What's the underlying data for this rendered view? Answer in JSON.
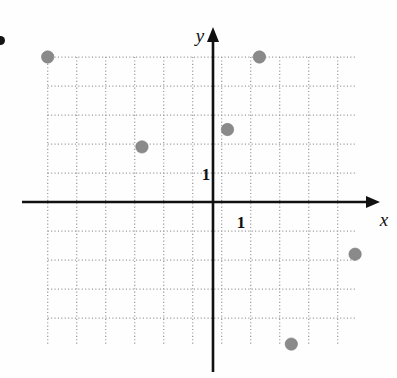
{
  "figure": {
    "problem_bullet": "•",
    "background_color": "#fefefe",
    "point_color": "#8a8a8a",
    "axis_color": "#111111",
    "grid_color": "#9a9a9a"
  },
  "chart_data": {
    "type": "scatter",
    "title": "",
    "subtitle": "",
    "xlabel": "x",
    "ylabel": "y",
    "annotations": [],
    "legend": [],
    "legend_position": "none",
    "grid": true,
    "grid_style": "dotted",
    "grid_step": 1,
    "xlim": [
      -5.7,
      4.9
    ],
    "ylim": [
      -4.9,
      5.0
    ],
    "xticks": [
      1
    ],
    "yticks": [
      1
    ],
    "xtick_labels": [
      "1"
    ],
    "ytick_labels": [
      "1"
    ],
    "axis_arrows": [
      "x-positive",
      "y-positive"
    ],
    "points": [
      {
        "label": "A",
        "x": -5.7,
        "y": 5.0
      },
      {
        "label": "B",
        "x": 1.6,
        "y": 5.0
      },
      {
        "label": "C",
        "x": 0.5,
        "y": 2.5
      },
      {
        "label": "D",
        "x": -2.45,
        "y": 1.9
      },
      {
        "label": "E",
        "x": 4.9,
        "y": -1.8
      },
      {
        "label": "F",
        "x": 2.7,
        "y": -4.9
      }
    ]
  }
}
